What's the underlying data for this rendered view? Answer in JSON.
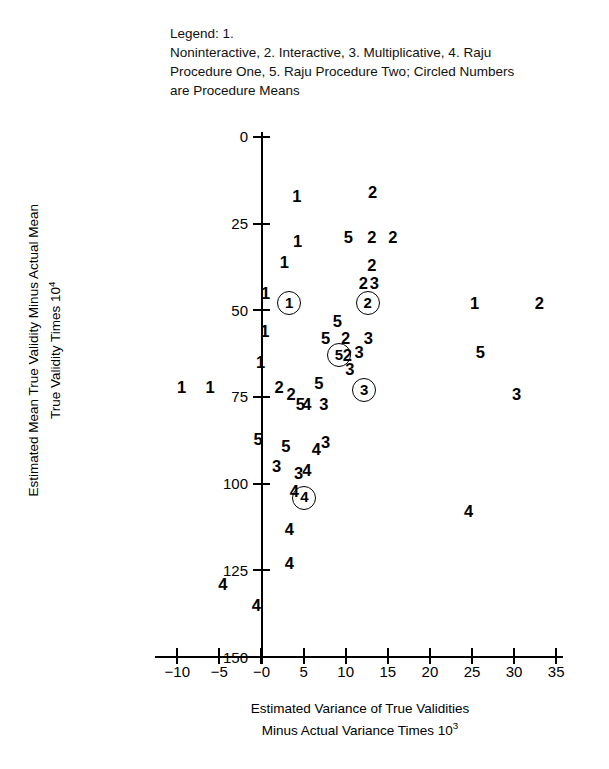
{
  "legend": {
    "lines": [
      "Legend: 1.",
      "Noninteractive, 2. Interactive, 3. Multiplicative, 4. Raju",
      "Procedure One, 5. Raju Procedure Two; Circled Numbers",
      "are Procedure Means"
    ],
    "full_text": "Legend: 1. Noninteractive, 2. Interactive, 3. Multiplicative, 4. Raju Procedure One, 5. Raju Procedure Two; Circled Numbers are Procedure Means"
  },
  "axes": {
    "x_title_line1": "Estimated Variance of True Validities",
    "x_title_line2_pre": "Minus Actual Variance Times 10",
    "x_title_exp": "3",
    "y_title_line1": "Estimated Mean True Validity Minus Actual Mean",
    "y_title_line2_pre": "True Validity Times 10",
    "y_title_exp": "4",
    "x_ticks": [
      "−10",
      "−5",
      "−0",
      "5",
      "10",
      "15",
      "20",
      "25",
      "30",
      "35"
    ],
    "y_ticks": [
      "150",
      "125",
      "100",
      "75",
      "50",
      "25",
      "0"
    ]
  },
  "chart_data": {
    "type": "scatter",
    "title": "",
    "xlabel": "Estimated Variance of True Validities Minus Actual Variance Times 10^3",
    "ylabel": "Estimated Mean True Validity Minus Actual Mean True Validity Times 10^4",
    "xlim": [
      -12,
      36
    ],
    "ylim": [
      0,
      150
    ],
    "xticks": [
      -10,
      -5,
      0,
      5,
      10,
      15,
      20,
      25,
      30,
      35
    ],
    "yticks": [
      0,
      25,
      50,
      75,
      100,
      125,
      150
    ],
    "grid": false,
    "legend_position": "top-left-textblock",
    "marker_style": "digit-glyph",
    "series": [
      {
        "name": "1. Noninteractive",
        "marker": "1"
      },
      {
        "name": "2. Interactive",
        "marker": "2"
      },
      {
        "name": "3. Multiplicative",
        "marker": "3"
      },
      {
        "name": "4. Raju Procedure One",
        "marker": "4"
      },
      {
        "name": "5. Raju Procedure Two",
        "marker": "5"
      }
    ],
    "points": [
      {
        "label": "1",
        "x": 4.2,
        "y": 133,
        "circled": false
      },
      {
        "label": "2",
        "x": 13.2,
        "y": 134,
        "circled": false
      },
      {
        "label": "1",
        "x": 4.3,
        "y": 120,
        "circled": false
      },
      {
        "label": "5",
        "x": 10.3,
        "y": 121,
        "circled": false
      },
      {
        "label": "2",
        "x": 13.1,
        "y": 121,
        "circled": false
      },
      {
        "label": "2",
        "x": 15.6,
        "y": 121,
        "circled": false
      },
      {
        "label": "1",
        "x": 2.7,
        "y": 114,
        "circled": false
      },
      {
        "label": "2",
        "x": 13.1,
        "y": 113,
        "circled": false
      },
      {
        "label": "2",
        "x": 12.1,
        "y": 108,
        "circled": false
      },
      {
        "label": "3",
        "x": 13.4,
        "y": 108,
        "circled": false
      },
      {
        "label": "1",
        "x": 0.5,
        "y": 105,
        "circled": false
      },
      {
        "label": "1",
        "x": 3.3,
        "y": 102,
        "circled": true
      },
      {
        "label": "2",
        "x": 12.6,
        "y": 102,
        "circled": true
      },
      {
        "label": "1",
        "x": 25.3,
        "y": 102,
        "circled": false
      },
      {
        "label": "2",
        "x": 33.0,
        "y": 102,
        "circled": false
      },
      {
        "label": "5",
        "x": 9.0,
        "y": 97,
        "circled": false
      },
      {
        "label": "1",
        "x": 0.4,
        "y": 94,
        "circled": false
      },
      {
        "label": "5",
        "x": 7.6,
        "y": 92,
        "circled": false
      },
      {
        "label": "2",
        "x": 10.0,
        "y": 92,
        "circled": false
      },
      {
        "label": "3",
        "x": 12.7,
        "y": 92,
        "circled": false
      },
      {
        "label": "5",
        "x": 9.2,
        "y": 87,
        "circled": true
      },
      {
        "label": "2",
        "x": 10.2,
        "y": 87,
        "circled": false
      },
      {
        "label": "3",
        "x": 11.6,
        "y": 88,
        "circled": false
      },
      {
        "label": "5",
        "x": 26.0,
        "y": 88,
        "circled": false
      },
      {
        "label": "1",
        "x": -0.1,
        "y": 85,
        "circled": false
      },
      {
        "label": "3",
        "x": 10.5,
        "y": 83,
        "circled": false
      },
      {
        "label": "5",
        "x": 6.8,
        "y": 79,
        "circled": false
      },
      {
        "label": "1",
        "x": -9.5,
        "y": 78,
        "circled": false
      },
      {
        "label": "1",
        "x": -6.1,
        "y": 78,
        "circled": false
      },
      {
        "label": "2",
        "x": 2.1,
        "y": 78,
        "circled": false
      },
      {
        "label": "2",
        "x": 3.5,
        "y": 76,
        "circled": false
      },
      {
        "label": "3",
        "x": 12.2,
        "y": 77,
        "circled": true
      },
      {
        "label": "3",
        "x": 30.3,
        "y": 76,
        "circled": false
      },
      {
        "label": "5",
        "x": 4.6,
        "y": 73,
        "circled": false
      },
      {
        "label": "4",
        "x": 5.4,
        "y": 73,
        "circled": false
      },
      {
        "label": "3",
        "x": 7.4,
        "y": 73,
        "circled": false
      },
      {
        "label": "5",
        "x": -0.4,
        "y": 63,
        "circled": false
      },
      {
        "label": "5",
        "x": 2.9,
        "y": 61,
        "circled": false
      },
      {
        "label": "4",
        "x": 6.5,
        "y": 60,
        "circled": false
      },
      {
        "label": "3",
        "x": 7.6,
        "y": 62,
        "circled": false
      },
      {
        "label": "3",
        "x": 1.8,
        "y": 55,
        "circled": false
      },
      {
        "label": "3",
        "x": 4.4,
        "y": 53,
        "circled": false
      },
      {
        "label": "4",
        "x": 5.4,
        "y": 54,
        "circled": false
      },
      {
        "label": "4",
        "x": 3.9,
        "y": 48,
        "circled": false
      },
      {
        "label": "4",
        "x": 5.1,
        "y": 46,
        "circled": true
      },
      {
        "label": "4",
        "x": 24.6,
        "y": 42,
        "circled": false
      },
      {
        "label": "4",
        "x": 3.3,
        "y": 37,
        "circled": false
      },
      {
        "label": "4",
        "x": 3.3,
        "y": 27,
        "circled": false
      },
      {
        "label": "4",
        "x": -4.6,
        "y": 21,
        "circled": false
      },
      {
        "label": "4",
        "x": -0.6,
        "y": 15,
        "circled": false
      }
    ]
  }
}
